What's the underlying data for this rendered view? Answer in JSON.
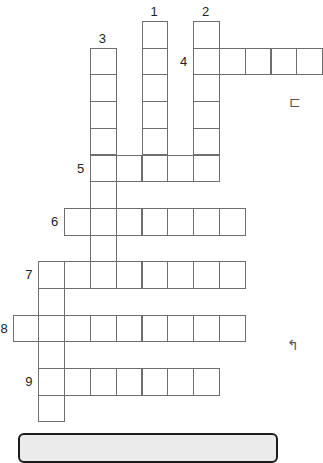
{
  "puzzle": {
    "grid": {
      "origin_x": 12.5,
      "origin_y": 21,
      "col_width": 25.8,
      "row_height": 26.7,
      "line_color": "#6e6e6e"
    },
    "words": [
      {
        "number": "1",
        "direction": "down",
        "col": 5,
        "row": 0,
        "length": 6,
        "label_dx": 0,
        "label_dy": -16
      },
      {
        "number": "2",
        "direction": "down",
        "col": 7,
        "row": 0,
        "length": 6,
        "label_dx": 0,
        "label_dy": -16
      },
      {
        "number": "3",
        "direction": "down",
        "col": 3,
        "row": 1,
        "length": 9,
        "label_dx": 0,
        "label_dy": -16
      },
      {
        "number": "4",
        "direction": "across",
        "col": 7,
        "row": 1,
        "length": 5,
        "label_dx": -13,
        "label_dy": 7
      },
      {
        "number": "5",
        "direction": "across",
        "col": 3,
        "row": 5,
        "length": 5,
        "label_dx": -13,
        "label_dy": 7
      },
      {
        "number": "6",
        "direction": "across",
        "col": 2,
        "row": 7,
        "length": 7,
        "label_dx": -13,
        "label_dy": 7
      },
      {
        "number": "7",
        "direction": "across",
        "col": 1,
        "row": 9,
        "length": 8,
        "label_dx": -13,
        "label_dy": 7
      },
      {
        "number": "7d",
        "direction": "down",
        "col": 1,
        "row": 9,
        "length": 6,
        "label": "",
        "label_dx": 0,
        "label_dy": 0
      },
      {
        "number": "8",
        "direction": "across",
        "col": 0,
        "row": 11,
        "length": 9,
        "label_dx": -12,
        "label_dy": 7
      },
      {
        "number": "9",
        "direction": "across",
        "col": 1,
        "row": 13,
        "length": 7,
        "label_dx": -13,
        "label_dy": 7
      }
    ],
    "edge_glyphs": [
      {
        "name": "bracket-glyph-icon",
        "char": "⊏",
        "x": 289,
        "y": 95
      },
      {
        "name": "hook-glyph-icon",
        "char": "↰",
        "x": 287,
        "y": 338
      }
    ],
    "clue_box": {
      "fill": "#ebebeb",
      "border": "#1c1c1c"
    }
  }
}
